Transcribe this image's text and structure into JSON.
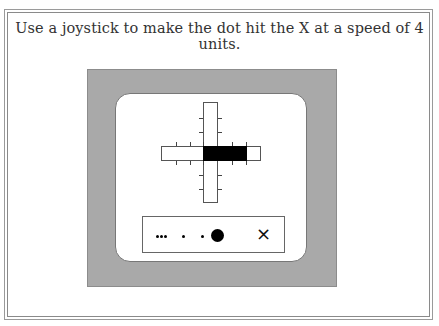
{
  "instruction": "Use a joystick to make the dot hit the X at a speed of 4 units.",
  "colors": {
    "panel": "#a9a9a9",
    "fill": "#000000",
    "background": "#ffffff"
  },
  "joystick": {
    "direction": "right",
    "fill_units": 4,
    "max_units": 4
  },
  "track": {
    "target_label": "×",
    "dot_trail": [
      "small",
      "small",
      "small",
      "small",
      "small",
      "large"
    ]
  }
}
